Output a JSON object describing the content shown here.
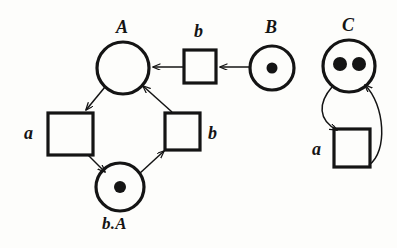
{
  "figure": {
    "kind": "petri-net-diagram",
    "background_color": "#fdfdfb",
    "stroke_color": "#141414"
  },
  "nets": [
    {
      "id": "net-left",
      "name": "cycle-net",
      "places": [
        {
          "id": "place-A",
          "label": "A",
          "tokens": 0,
          "cx": 123,
          "cy": 68,
          "r": 26,
          "label_x": 116,
          "label_y": 18
        },
        {
          "id": "place-bA",
          "label": "b.A",
          "tokens": 1,
          "cx": 120,
          "cy": 187,
          "r": 24,
          "label_x": 102,
          "label_y": 215
        }
      ],
      "transitions": [
        {
          "id": "trans-b-top",
          "label": "b",
          "x": 184,
          "y": 50,
          "w": 32,
          "h": 33,
          "label_x": 194,
          "label_y": 22
        },
        {
          "id": "trans-a-left",
          "label": "a",
          "x": 48,
          "y": 113,
          "w": 45,
          "h": 42,
          "label_x": 24,
          "label_y": 124
        },
        {
          "id": "trans-b-right",
          "label": "b",
          "x": 165,
          "y": 113,
          "w": 35,
          "h": 37,
          "label_x": 208,
          "label_y": 124
        }
      ]
    },
    {
      "id": "net-right",
      "name": "self-loop-net",
      "places": [
        {
          "id": "place-B",
          "label": "B",
          "tokens": 1,
          "cx": 272,
          "cy": 68,
          "r": 22,
          "label_x": 265,
          "label_y": 18
        },
        {
          "id": "place-C",
          "label": "C",
          "tokens": 2,
          "cx": 349,
          "cy": 66,
          "r": 26,
          "label_x": 342,
          "label_y": 16
        }
      ],
      "transitions": [
        {
          "id": "trans-a-right",
          "label": "a",
          "x": 334,
          "y": 129,
          "w": 36,
          "h": 38,
          "label_x": 312,
          "label_y": 140
        }
      ]
    }
  ],
  "arcs": [
    {
      "id": "arc-B-to-b",
      "from": "place-B",
      "to": "trans-b-top",
      "direction": "place-to-transition"
    },
    {
      "id": "arc-b-to-A",
      "from": "trans-b-top",
      "to": "place-A",
      "direction": "transition-to-place"
    },
    {
      "id": "arc-A-to-a",
      "from": "place-A",
      "to": "trans-a-left",
      "direction": "place-to-transition"
    },
    {
      "id": "arc-a-to-bA",
      "from": "trans-a-left",
      "to": "place-bA",
      "direction": "transition-to-place"
    },
    {
      "id": "arc-bA-to-b",
      "from": "place-bA",
      "to": "trans-b-right",
      "direction": "place-to-transition"
    },
    {
      "id": "arc-b-to-A-right",
      "from": "trans-b-right",
      "to": "place-A",
      "direction": "transition-to-place"
    },
    {
      "id": "arc-C-to-a-curved",
      "from": "place-C",
      "to": "trans-a-right",
      "direction": "place-to-transition",
      "style": "curved-left"
    },
    {
      "id": "arc-a-to-C-curved",
      "from": "trans-a-right",
      "to": "place-C",
      "direction": "transition-to-place",
      "style": "curved-right"
    }
  ]
}
